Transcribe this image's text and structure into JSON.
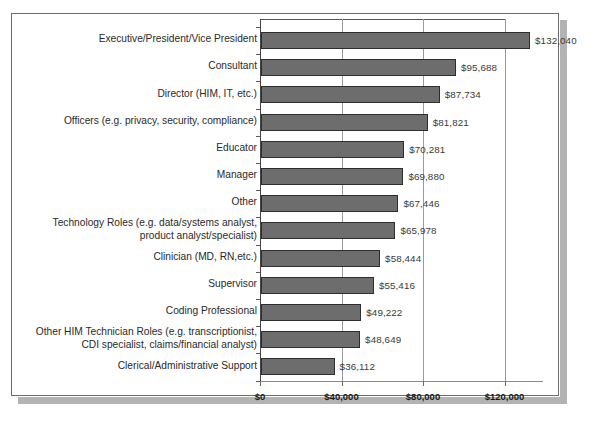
{
  "chart_data": {
    "type": "bar",
    "orientation": "horizontal",
    "title": "",
    "subtitle": "",
    "xlabel": "",
    "ylabel": "",
    "xlim": [
      0,
      140000
    ],
    "grid": true,
    "legend": false,
    "value_prefix": "$",
    "axis_ticks": [
      {
        "value": 0,
        "label": "$0"
      },
      {
        "value": 40000,
        "label": "$40,000"
      },
      {
        "value": 80000,
        "label": "$80,000"
      },
      {
        "value": 120000,
        "label": "$120,000"
      }
    ],
    "categories": [
      "Executive/President/Vice President",
      "Consultant",
      "Director (HIM, IT, etc.)",
      "Officers (e.g. privacy, security, compliance)",
      "Educator",
      "Manager",
      "Other",
      "Technology Roles (e.g. data/systems analyst,\nproduct analyst/specialist)",
      "Clinician (MD, RN,etc.)",
      "Supervisor",
      "Coding Professional",
      "Other HIM Technician Roles (e.g. transcriptionist,\nCDI specialist, claims/financial analyst)",
      "Clerical/Administrative Support"
    ],
    "values": [
      132040,
      95688,
      87734,
      81821,
      70281,
      69880,
      67446,
      65978,
      58444,
      55416,
      49222,
      48649,
      36112
    ],
    "value_labels": [
      "$132,040",
      "$95,688",
      "$87,734",
      "$81,821",
      "$70,281",
      "$69,880",
      "$67,446",
      "$65,978",
      "$58,444",
      "$55,416",
      "$49,222",
      "$48,649",
      "$36,112"
    ],
    "colors": {
      "bar_fill": "#6d6d6d",
      "bar_stroke": "#2e2e2e",
      "gridline": "#9b9b9b",
      "axis": "#444444",
      "value_text": "#3a3a3a",
      "category_text": "#2a2a2a",
      "frame": "#6d6d6d",
      "shadow": "#b3b3b3",
      "background": "#ffffff"
    }
  }
}
